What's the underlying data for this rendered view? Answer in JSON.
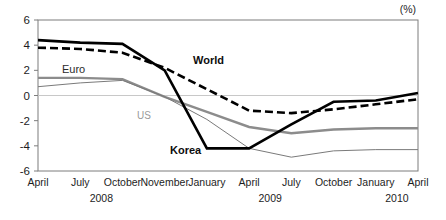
{
  "unit": "(%)",
  "axis": {
    "y_ticks": [
      "6",
      "4",
      "2",
      "0",
      "-2",
      "-4",
      "-6"
    ],
    "y_min": -6,
    "y_max": 6
  },
  "labels": {
    "world": "World",
    "korea": "Korea",
    "euro": "Euro",
    "us": "US"
  },
  "years": [
    {
      "label": "2008"
    },
    {
      "label": "2009"
    },
    {
      "label": "2010"
    }
  ],
  "chart_data": {
    "type": "line",
    "title": "",
    "subtitle": "",
    "xlabel": "",
    "ylabel": "",
    "unit": "(%)",
    "ylim": [
      -6,
      6
    ],
    "yticks": [
      -6,
      -4,
      -2,
      0,
      2,
      4,
      6
    ],
    "grid": false,
    "zero_line": true,
    "legend": "inline-annotations",
    "categories": [
      "April",
      "July",
      "October",
      "November",
      "January",
      "April",
      "July",
      "October",
      "January",
      "April"
    ],
    "category_years": [
      "2008",
      "2008",
      "2008",
      "2008",
      "2009",
      "2009",
      "2009",
      "2009",
      "2010",
      "2010"
    ],
    "series": [
      {
        "name": "Korea",
        "style": "solid-thick-black",
        "color": "#000000",
        "values": [
          4.4,
          4.2,
          4.1,
          2.0,
          -4.2,
          -4.2,
          -2.3,
          -0.5,
          -0.4,
          0.2
        ]
      },
      {
        "name": "World",
        "style": "dashed-thick-black",
        "color": "#000000",
        "values": [
          3.8,
          3.7,
          3.4,
          2.2,
          0.5,
          -1.2,
          -1.4,
          -1.1,
          -0.7,
          -0.3
        ]
      },
      {
        "name": "Euro",
        "style": "solid-medium-gray",
        "color": "#8c8c8c",
        "values": [
          1.4,
          1.4,
          1.3,
          -0.1,
          -1.3,
          -2.5,
          -3.0,
          -2.7,
          -2.6,
          -2.6
        ]
      },
      {
        "name": "US",
        "style": "solid-thin-gray",
        "color": "#8c8c8c",
        "values": [
          0.7,
          1.0,
          1.2,
          -0.1,
          -1.9,
          -4.2,
          -4.9,
          -4.4,
          -4.3,
          -4.3
        ]
      }
    ],
    "annotations": [
      {
        "text": "World",
        "series": "World"
      },
      {
        "text": "Korea",
        "series": "Korea"
      },
      {
        "text": "Euro",
        "series": "Euro"
      },
      {
        "text": "US",
        "series": "US"
      }
    ]
  }
}
